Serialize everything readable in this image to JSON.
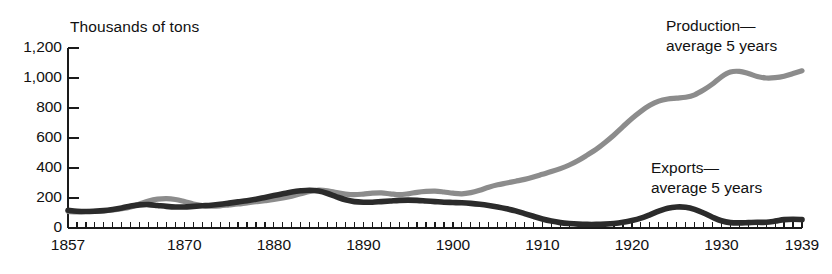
{
  "chart_data": {
    "type": "line",
    "title": "",
    "subtitle": "",
    "ylabel": "Thousands of tons",
    "xlabel": "",
    "ylim": [
      0,
      1200
    ],
    "xlim": [
      1857,
      1939
    ],
    "grid": false,
    "legend_position": "inline-annotations",
    "y_ticks": [
      0,
      200,
      400,
      600,
      800,
      1000,
      1200
    ],
    "y_tick_labels": [
      "0",
      "200",
      "400",
      "600",
      "800",
      "1,000",
      "1,200"
    ],
    "x_ticks": [
      1857,
      1870,
      1880,
      1890,
      1900,
      1910,
      1920,
      1930,
      1939
    ],
    "x_tick_labels": [
      "1857",
      "1870",
      "1880",
      "1890",
      "1900",
      "1910",
      "1920",
      "1930",
      "1939"
    ],
    "x_minor_tick_interval": 1,
    "annotations": [
      {
        "name": "production-label",
        "line1": "Production—",
        "line2": "average 5 years",
        "x_px": 666,
        "y_px": 16
      },
      {
        "name": "exports-label",
        "line1": "Exports—",
        "line2": "average 5 years",
        "x_px": 651,
        "y_px": 158
      }
    ],
    "x": [
      1857,
      1858,
      1859,
      1860,
      1861,
      1862,
      1863,
      1864,
      1865,
      1866,
      1867,
      1868,
      1869,
      1870,
      1871,
      1872,
      1873,
      1874,
      1875,
      1876,
      1877,
      1878,
      1879,
      1880,
      1881,
      1882,
      1883,
      1884,
      1885,
      1886,
      1887,
      1888,
      1889,
      1890,
      1891,
      1892,
      1893,
      1894,
      1895,
      1896,
      1897,
      1898,
      1899,
      1900,
      1901,
      1902,
      1903,
      1904,
      1905,
      1906,
      1907,
      1908,
      1909,
      1910,
      1911,
      1912,
      1913,
      1914,
      1915,
      1916,
      1917,
      1918,
      1919,
      1920,
      1921,
      1922,
      1923,
      1924,
      1925,
      1926,
      1927,
      1928,
      1929,
      1930,
      1931,
      1932,
      1933,
      1934,
      1935,
      1936,
      1937,
      1938,
      1939
    ],
    "series": [
      {
        "name": "Production—average 5 years",
        "color": "#8c8c8c",
        "values": [
          110,
          108,
          110,
          112,
          115,
          120,
          128,
          140,
          160,
          180,
          192,
          196,
          190,
          176,
          160,
          150,
          146,
          148,
          154,
          160,
          168,
          175,
          182,
          190,
          200,
          212,
          228,
          244,
          252,
          248,
          236,
          226,
          222,
          226,
          232,
          234,
          228,
          222,
          228,
          238,
          244,
          246,
          240,
          232,
          228,
          236,
          252,
          272,
          288,
          300,
          312,
          324,
          340,
          358,
          376,
          396,
          420,
          450,
          486,
          524,
          570,
          620,
          676,
          730,
          778,
          818,
          846,
          860,
          866,
          872,
          888,
          920,
          960,
          1008,
          1040,
          1044,
          1030,
          1010,
          1000,
          1002,
          1012,
          1030,
          1048
        ]
      },
      {
        "name": "Exports—average 5 years",
        "color": "#2b2b2b",
        "values": [
          118,
          112,
          110,
          112,
          116,
          124,
          134,
          146,
          154,
          156,
          150,
          144,
          140,
          140,
          144,
          148,
          152,
          158,
          166,
          174,
          182,
          192,
          204,
          216,
          228,
          240,
          248,
          252,
          246,
          230,
          208,
          188,
          176,
          172,
          172,
          176,
          180,
          184,
          186,
          184,
          180,
          176,
          172,
          170,
          168,
          164,
          158,
          150,
          140,
          128,
          114,
          96,
          78,
          60,
          46,
          36,
          30,
          26,
          24,
          24,
          26,
          30,
          38,
          50,
          66,
          88,
          112,
          132,
          140,
          138,
          124,
          100,
          72,
          48,
          36,
          34,
          36,
          38,
          38,
          46,
          56,
          58,
          56
        ]
      }
    ]
  },
  "geometry": {
    "plot_left_px": 68,
    "plot_right_px": 802,
    "y_zero_px": 228,
    "y_top_px": 48,
    "units_per_px": 6.6667
  }
}
